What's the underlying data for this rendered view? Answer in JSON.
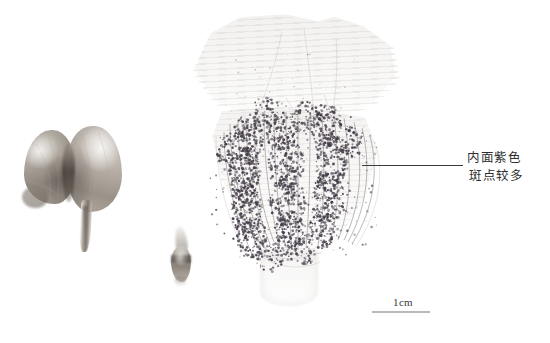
{
  "figure": {
    "background_color": "#ffffff",
    "width": 550,
    "height": 343,
    "kind": "botanical-specimen-scan"
  },
  "specimens": [
    {
      "id": "left-bracts",
      "name": "paired-bract-specimen",
      "description": "two grayish-brown lobed bracts joined at a dark cleft, tapering to a narrow stalk",
      "color": "#a39b92"
    },
    {
      "id": "mid-bud",
      "name": "small-bud-specimen",
      "description": "small elongated bud with pale wispy tip and dark transverse band",
      "color": "#9c948b"
    },
    {
      "id": "main-perianth",
      "name": "dissected-perianth-specimen",
      "description": "large flattened perianth, pale translucent upper lamina with faint striations, lower funnel densely speckled with dark purple dots and radiating veins, pale tubular base",
      "color": "#eceae7",
      "speckle_color": "#433b47",
      "vein_color": "#6d6a66"
    }
  ],
  "annotation": {
    "line1": "内面紫色",
    "line2": "斑点较多",
    "text_color": "#2e2e2e",
    "leader_line_color": "#3b3b3b"
  },
  "scale_bar": {
    "label": "1cm",
    "rule_color": "#b9b9b9",
    "label_color": "#3a3a3a"
  }
}
